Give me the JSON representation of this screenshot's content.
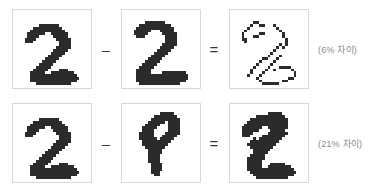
{
  "page": {
    "background_color": "#ffffff",
    "box_border_color": "#d8d8d8",
    "ink_color": "#2b2b2b",
    "label_color": "#8a8a8a",
    "operator_color": "#3a3a3a"
  },
  "operators": {
    "minus": "–",
    "equals": "="
  },
  "rows": [
    {
      "id": "row-0",
      "left_image": {
        "name": "digit-2-a",
        "alt_text": "2"
      },
      "minus": "–",
      "right_image": {
        "name": "digit-2-b",
        "alt_text": "2"
      },
      "equals": "=",
      "diff_image": {
        "name": "difference-2-vs-2",
        "alt_text": "sparse difference"
      },
      "percent_label": "(6% 차이)",
      "percent_value": 6
    },
    {
      "id": "row-1",
      "left_image": {
        "name": "digit-2-c",
        "alt_text": "2"
      },
      "minus": "–",
      "right_image": {
        "name": "digit-9",
        "alt_text": "9"
      },
      "equals": "=",
      "diff_image": {
        "name": "difference-2-vs-9",
        "alt_text": "dense difference"
      },
      "percent_label": "(21% 차이)",
      "percent_value": 21
    }
  ],
  "bitmaps": {
    "digit_2_a": [
      "000000000000000000000000000",
      "000000000000000000000000000",
      "000000000000000000000000000",
      "000000000000000000000000000",
      "000000000000000000000000000",
      "000000000111111100000000000",
      "000000011111111110000000000",
      "000000111111111111000000000",
      "000001111110011111100000000",
      "000001111000001111100000000",
      "000011110000000111110000000",
      "000011100000000011110000000",
      "000000000000000011110000000",
      "000000000000000111110000000",
      "000000000000001111100000000",
      "000000000000011111000000000",
      "000000000000111110000000000",
      "000000000001111100000000000",
      "000000000011111000000000000",
      "000000000111110000000000000",
      "000000001111100000000000000",
      "000000011111000011100000000",
      "000000111110011111111000000",
      "000000111111111111111100000",
      "000000111111111111111110000",
      "000000111111111111111100000",
      "000000001111111111110000000",
      "000000000000000000000000000"
    ],
    "digit_2_b": [
      "000000000000000000000000000",
      "000000000000000000000000000",
      "000000000000000000000000000",
      "000000000000000000000000000",
      "000000001111111000000000000",
      "000000111111111110000000000",
      "000001111111111111000000000",
      "000011111100011111000000000",
      "000011111000001111100000000",
      "000001110000000111100000000",
      "000000000000000111100000000",
      "000000000000000111100000000",
      "000000000000001111100000000",
      "000000000000011111000000000",
      "000000000000111110000000000",
      "000000000001111100000000000",
      "000000000011111000000000000",
      "000000000111110000000000000",
      "000000001111100000000000000",
      "000000011111000000000000000",
      "000000111110000000000000000",
      "000001111100000000000000000",
      "000001111100001111111100000",
      "000001111111111111111110000",
      "000001111111111111111110000",
      "000001111111111111111100000",
      "000000111111111111110000000",
      "000000000000000000000000000"
    ],
    "digit_2_c": [
      "000000000000000000000000000",
      "000000000000000000000000000",
      "000000000000000000000000000",
      "000000000000000000000000000",
      "000000000000000000000000000",
      "000000000111111100000000000",
      "000000011111111110000000000",
      "000000111111111111000000000",
      "000001111110011111100000000",
      "000001111000001111100000000",
      "000011110000000111110000000",
      "000011100000000011110000000",
      "000000000000000011110000000",
      "000000000000000111110000000",
      "000000000000001111100000000",
      "000000000000011111000000000",
      "000000000000111110000000000",
      "000000000001111100000000000",
      "000000000011111000000000000",
      "000000000111110000000000000",
      "000000001111100000000000000",
      "000000011111000011100000000",
      "000000111110011111111000000",
      "000000111111111111111100000",
      "000000111111111111111110000",
      "000000111111111111111100000",
      "000000001111111111110000000",
      "000000000000000000000000000"
    ],
    "digit_9": [
      "000000000000000000000000000",
      "000000000000000000000000000",
      "000000000000000000000000000",
      "000000000000011111000000000",
      "000000000001111111100000000",
      "000000000011111111110000000",
      "000000000111111011110000000",
      "000000001111100011110000000",
      "000000011111000011110000000",
      "000000011110000011110000000",
      "000000111110000111110000000",
      "000000111110001111100000000",
      "000000111111011111000000000",
      "000000011111111110000000000",
      "000000011111111100000000000",
      "000000001111111000000000000",
      "000000000111110000000000000",
      "000000000111110000000000000",
      "000000000111100000000000000",
      "000000000111100000000000000",
      "000000000111100000000000000",
      "000000000011110000000000000",
      "000000000011110000000000000",
      "000000000011110000000000000",
      "000000000011100000000000000",
      "000000000001100000000000000",
      "000000000000000000000000000",
      "000000000000000000000000000"
    ],
    "diff_2_2": [
      "000000000000000000000000000",
      "000000000000000000000000000",
      "000000000000000000000000000",
      "000000000000000000000000000",
      "000000001100000000000000000",
      "000000010011000100000000000",
      "000000100000000010000000000",
      "000001000000000001000000000",
      "000010000011000000100000000",
      "000010001100000000100000000",
      "000011000000000000010000000",
      "000001000000000000010000000",
      "000000000000000001010000000",
      "000000000000000010100000000",
      "000000000000000100000000000",
      "000000000000001000000000000",
      "000000000000010001000000000",
      "000000000001100010000000000",
      "000000000010000100000000000",
      "000000000100001000000000000",
      "000000001000010001111000000",
      "000000010000100100000100000",
      "000000010001000000000010000",
      "000000100010000000000010000",
      "000000000100000000001100000",
      "000000000010000000110000000",
      "000000000001111110000000000",
      "000000000000000000000000000"
    ],
    "diff_2_9": [
      "000000000000000000000000000",
      "000000000000000000000000000",
      "000000000000000000000000000",
      "000000000000011111000000000",
      "000000000111111111100000000",
      "000000011111111111110000000",
      "000000111111111111110000000",
      "000001111111111111110000000",
      "000011111110011111110000000",
      "000011111100001111100000000",
      "000011110000011111110000000",
      "000011100001111111100000000",
      "000000001011111111000000000",
      "000000011111111110000000000",
      "000000111111111100000000000",
      "000000011111111000000000000",
      "000000001111110000000000000",
      "000000001111100000000000000",
      "000000011111000000000000000",
      "000000111111000000000000000",
      "000000111110000000000000000",
      "000000111110001111100000000",
      "000000111110011111111000000",
      "000000111111111111111100000",
      "000000011111111111111110000",
      "000000001111111111111100000",
      "000000000111111111110000000",
      "000000000000000000000000000"
    ]
  }
}
